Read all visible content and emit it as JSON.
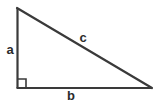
{
  "figure": {
    "name": "right-triangle",
    "background_color": "#ffffff",
    "stroke_color": "#3a3a3a",
    "label_color": "#2b2b2b",
    "width": 160,
    "height": 104
  },
  "geometry": {
    "apex": {
      "x": 17,
      "y": 8
    },
    "right_angle_vertex": {
      "x": 17,
      "y": 88
    },
    "base_right_vertex": {
      "x": 152,
      "y": 88
    },
    "right_angle_marker_size": 9
  },
  "labels": {
    "leg_vertical": "a",
    "base_horizontal": "b",
    "hypotenuse": "c"
  },
  "sides": [
    {
      "id": "a",
      "role": "vertical-leg",
      "label": "a"
    },
    {
      "id": "b",
      "role": "horizontal-leg",
      "label": "b"
    },
    {
      "id": "c",
      "role": "hypotenuse",
      "label": "c"
    }
  ]
}
